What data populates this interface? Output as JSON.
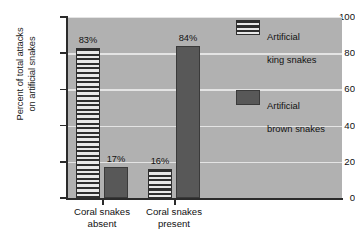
{
  "chart_data": {
    "type": "bar",
    "title": "",
    "xlabel": "",
    "ylabel": "Percent of total attacks\non artificial snakes",
    "ylabel_line1": "Percent of total attacks",
    "ylabel_line2": "on artificial snakes",
    "categories": [
      "Coral snakes absent",
      "Coral snakes present"
    ],
    "category_lines": [
      [
        "Coral snakes",
        "absent"
      ],
      [
        "Coral snakes",
        "present"
      ]
    ],
    "series": [
      {
        "name": "Artificial king snakes",
        "name_line1": "Artificial",
        "name_line2": "king snakes",
        "values": [
          83,
          16
        ],
        "labels": [
          "83%",
          "16%"
        ],
        "pattern": "horizontal-stripes",
        "color": "#e8e8e8"
      },
      {
        "name": "Artificial brown snakes",
        "name_line1": "Artificial",
        "name_line2": "brown snakes",
        "values": [
          17,
          84
        ],
        "labels": [
          "17%",
          "84%"
        ],
        "pattern": "solid",
        "color": "#585858"
      }
    ],
    "ylim": [
      0,
      100
    ],
    "yticks": [
      0,
      20,
      40,
      60,
      80,
      100
    ],
    "ytick_labels": [
      "0",
      "20",
      "40",
      "60",
      "80",
      "100"
    ],
    "grid": true,
    "grid_color": "#ededed",
    "legend_position": "top-right",
    "plot_background": "#b1b1b1",
    "figure_background": "#ffffff",
    "axis_color": "#2b2b2b"
  }
}
